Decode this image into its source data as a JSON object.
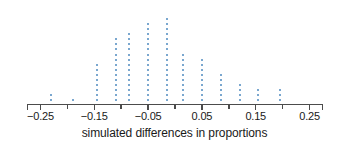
{
  "chart_data": {
    "type": "scatter",
    "plot_style": "dotplot",
    "title": "",
    "xlabel": "simulated differences in proportions",
    "ylabel": "",
    "xlim": [
      -0.275,
      0.275
    ],
    "ylim": [
      0,
      18
    ],
    "grid": false,
    "legend": null,
    "dot_color": "#7aa7cf",
    "axis_color": "#4c4c4c",
    "text_color": "#1a1a1a",
    "x_major_ticks": [
      -0.25,
      -0.15,
      -0.05,
      0.05,
      0.15,
      0.25
    ],
    "x_major_tick_labels": [
      "−0.25",
      "−0.15",
      "−0.05",
      "0.05",
      "0.15",
      "0.25"
    ],
    "x_minor_ticks": [
      -0.2,
      -0.1,
      0.0,
      0.1,
      0.2
    ],
    "x": [
      -0.23,
      -0.19,
      -0.145,
      -0.11,
      -0.085,
      -0.05,
      -0.015,
      0.015,
      0.05,
      0.085,
      0.12,
      0.155,
      0.195
    ],
    "counts": [
      2,
      1,
      8,
      13,
      14,
      16,
      17,
      10,
      9,
      6,
      4,
      3,
      3
    ],
    "total_dots": 106
  }
}
